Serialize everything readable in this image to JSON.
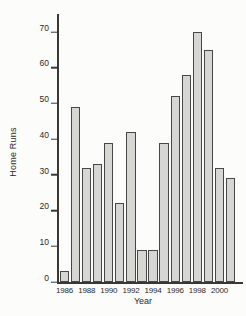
{
  "chart_data": {
    "type": "bar",
    "title": "",
    "xlabel": "Year",
    "ylabel": "Home Runs",
    "categories": [
      1986,
      1987,
      1988,
      1989,
      1990,
      1991,
      1992,
      1993,
      1994,
      1995,
      1996,
      1997,
      1998,
      1999,
      2000,
      2001
    ],
    "values": [
      3,
      49,
      32,
      33,
      39,
      22,
      42,
      9,
      9,
      39,
      52,
      58,
      70,
      65,
      32,
      29
    ],
    "x_tick_labels": [
      "1986",
      "1988",
      "1990",
      "1992",
      "1994",
      "1996",
      "1998",
      "2000"
    ],
    "x_tick_step": 2,
    "y_ticks": [
      0,
      10,
      20,
      30,
      40,
      50,
      60,
      70
    ],
    "ylim": [
      0,
      75
    ],
    "grid": false,
    "legend": "none",
    "colors": {
      "bar_fill": "#d6d6d3",
      "bar_border": "#474745",
      "axis": "#383836",
      "text": "#2b2b29",
      "background": "#fcfcfa"
    }
  }
}
